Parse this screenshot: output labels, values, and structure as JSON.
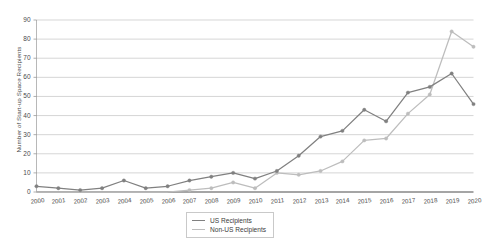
{
  "chart_data": {
    "type": "line",
    "title": "",
    "subtitle": "",
    "xlabel": "",
    "ylabel": "Number of Start-up Space Recipients",
    "categories": [
      "2000",
      "2001",
      "2002",
      "2003",
      "2004",
      "2005",
      "2006",
      "2007",
      "2008",
      "2009",
      "2010",
      "2011",
      "2012",
      "2013",
      "2014",
      "2015",
      "2016",
      "2017",
      "2018",
      "2019",
      "2020"
    ],
    "x": [
      2000,
      2001,
      2002,
      2003,
      2004,
      2005,
      2006,
      2007,
      2008,
      2009,
      2010,
      2011,
      2012,
      2013,
      2014,
      2015,
      2016,
      2017,
      2018,
      2019,
      2020
    ],
    "series": [
      {
        "name": "US Recipients",
        "color": "#808080",
        "marker": "circle",
        "values": [
          3,
          2,
          1,
          2,
          6,
          2,
          3,
          6,
          8,
          10,
          7,
          11,
          19,
          29,
          32,
          43,
          37,
          52,
          55,
          62,
          46
        ]
      },
      {
        "name": "Non-US Recipients",
        "color": "#bdbdbd",
        "marker": "circle",
        "values": [
          0,
          0,
          0,
          0,
          0,
          0,
          0,
          1,
          2,
          5,
          2,
          10,
          9,
          11,
          16,
          27,
          28,
          41,
          51,
          84,
          76
        ]
      }
    ],
    "ylim": [
      0,
      90
    ],
    "yticks": [
      0,
      10,
      20,
      30,
      40,
      50,
      60,
      70,
      80,
      90
    ],
    "ytick_labels": [
      "0",
      "10",
      "20",
      "30",
      "40",
      "50",
      "60",
      "70",
      "80",
      "90"
    ],
    "grid": true,
    "grid_axis": "y",
    "legend_position": "bottom-center",
    "background": "#ffffff",
    "grid_color": "#c4c4c4",
    "axis_color": "#555555",
    "text_color": "#4a4a4a"
  },
  "legend": {
    "entries": [
      {
        "label": "US Recipients"
      },
      {
        "label": "Non-US Recipients"
      }
    ]
  }
}
